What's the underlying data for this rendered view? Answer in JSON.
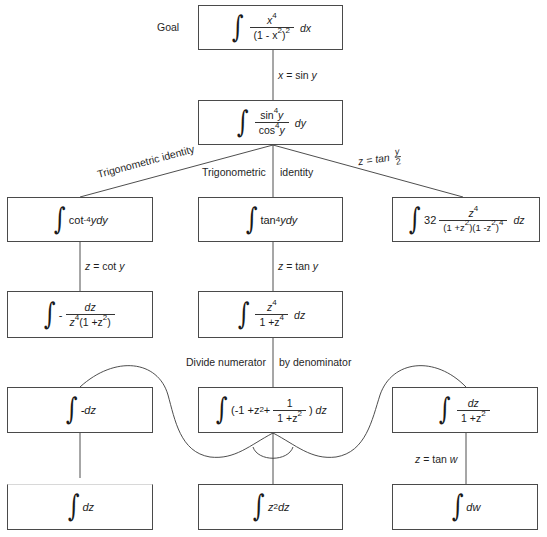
{
  "diagram": {
    "goal_label": "Goal",
    "nodes": {
      "goal": {
        "integral": "∫",
        "num": "x⁴",
        "num_base": "x",
        "num_exp": "4",
        "den": "(1 - x²)²",
        "den_base": "(1 - x",
        "den_exp1": "2",
        "den_close": ")",
        "den_exp2": "2",
        "tail": "dx"
      },
      "sin_cos": {
        "integral": "∫",
        "num_base": "sin",
        "num_exp": "4",
        "num_var": "y",
        "den_base": "cos",
        "den_exp": "4",
        "den_var": "y",
        "tail": "dy"
      },
      "cot": {
        "integral": "∫",
        "base": "cot",
        "exp": "-4",
        "tail": "ydy"
      },
      "tan": {
        "integral": "∫",
        "base": "tan",
        "exp": "4",
        "tail": "ydy"
      },
      "weierstrass": {
        "integral": "∫",
        "coef": "32",
        "num_base": "z",
        "num_exp": "4",
        "den_a": "(1 +z",
        "den_a_exp": "2",
        "den_b": ")(1 -z",
        "den_b_exp": "2",
        "den_c": ")",
        "den_c_exp": "4",
        "tail": "dz"
      },
      "cot_sub": {
        "integral": "∫",
        "sign": "-",
        "num": "dz",
        "den_a": "z",
        "den_a_exp": "4",
        "den_b": "(1 +z",
        "den_b_exp": "2",
        "den_c": ")"
      },
      "tan_sub": {
        "integral": "∫",
        "num_base": "z",
        "num_exp": "4",
        "den_a": "1 +z",
        "den_a_exp": "4",
        "tail": "dz"
      },
      "neg_dz": {
        "integral": "∫",
        "body": "-dz"
      },
      "division": {
        "integral": "∫",
        "open": "(-1 +z",
        "exp": "2",
        "plus": "+",
        "num": "1",
        "den_a": "1 +z",
        "den_a_exp": "2",
        "close": ")",
        "tail": "dz"
      },
      "arctan_form": {
        "integral": "∫",
        "num": "dz",
        "den_a": "1 +z",
        "den_a_exp": "2"
      },
      "dz": {
        "integral": "∫",
        "body": "dz"
      },
      "z2dz": {
        "integral": "∫",
        "base": "z",
        "exp": "2",
        "tail": "dz"
      },
      "dw": {
        "integral": "∫",
        "body": "dw"
      }
    },
    "edge_labels": {
      "x_sub_var": "x",
      "x_sub_rest": "= sin",
      "x_sub_y": "y",
      "trig_identity_left": "Trigonometric identity",
      "trig_identity_mid_a": "Trigonometric",
      "trig_identity_mid_b": "identity",
      "z_tan_half_var": "z",
      "z_tan_half_rest": "= tan",
      "z_tan_half_num": "y",
      "z_tan_half_den": "2",
      "z_cot_var": "z",
      "z_cot_rest": "= cot",
      "z_cot_y": "y",
      "z_tan_var": "z",
      "z_tan_rest": "= tan",
      "z_tan_y": "y",
      "divide_a": "Divide numerator",
      "divide_b": "by denominator",
      "z_tanw_var": "z",
      "z_tanw_rest": "= tan",
      "z_tanw_w": "w"
    },
    "colors": {
      "line": "#3a3a3a",
      "box_border": "#4a4a4a",
      "background": "#ffffff",
      "text": "#1a1a1a"
    }
  }
}
